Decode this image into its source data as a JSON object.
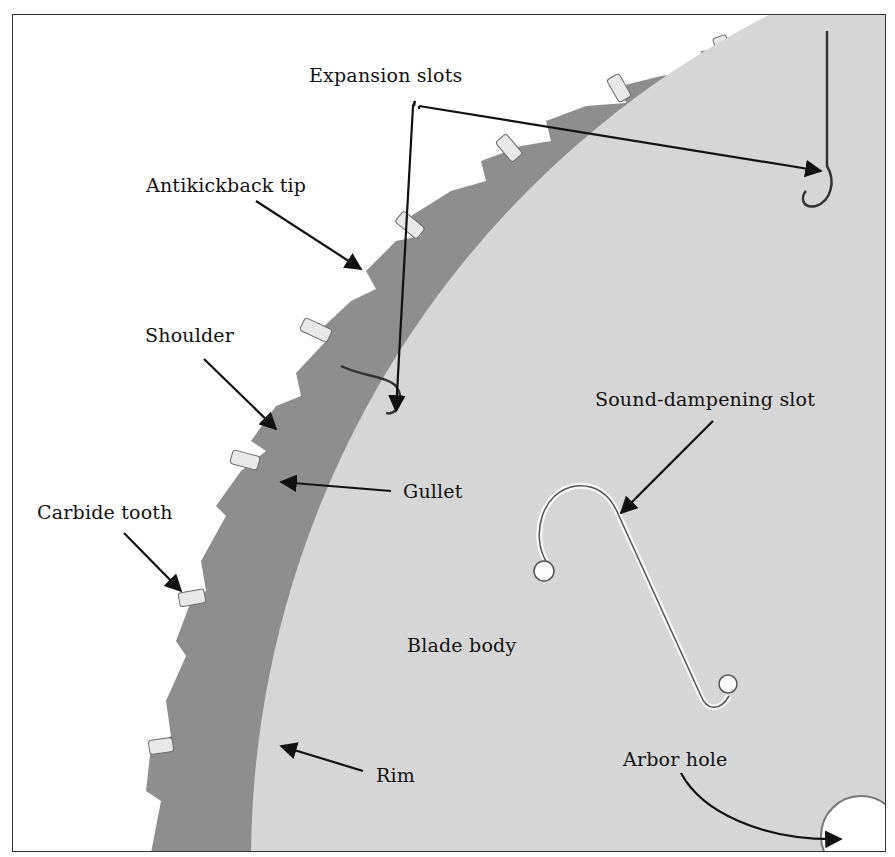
{
  "figure": {
    "labels": {
      "expansion_slots": "Expansion slots",
      "antikickback_tip": "Antikickback tip",
      "shoulder": "Shoulder",
      "gullet": "Gullet",
      "carbide_tooth": "Carbide tooth",
      "sound_dampening_slot": "Sound-dampening slot",
      "blade_body": "Blade body",
      "rim": "Rim",
      "arbor_hole": "Arbor hole"
    },
    "colors": {
      "rim": "#8e8e8e",
      "blade_body": "#d6d6d6",
      "tooth_tip": "#e4e4e4",
      "background": "#ffffff",
      "ink": "#111111"
    }
  }
}
